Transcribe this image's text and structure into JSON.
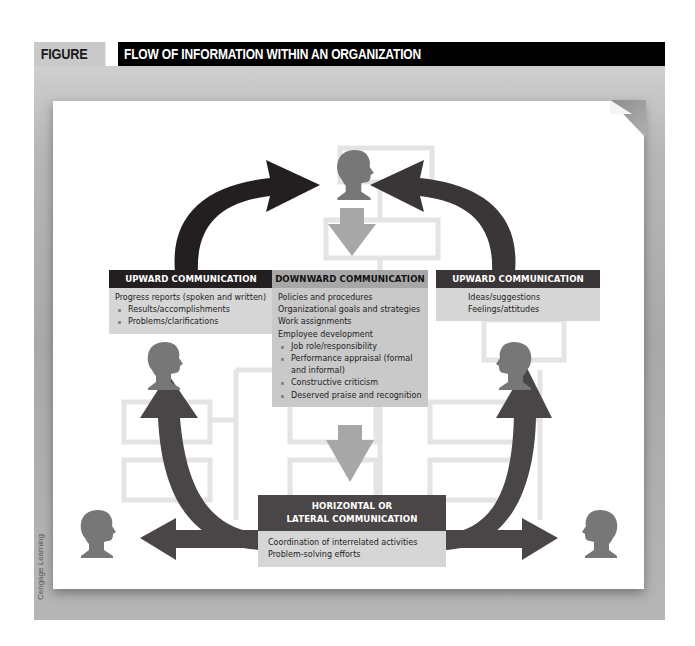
{
  "figure": {
    "number": "FIGURE 1.2",
    "title": "FLOW OF INFORMATION WITHIN AN ORGANIZATION",
    "credit": "Cengage Learning"
  },
  "colors": {
    "header_bg": "#000000",
    "number_bg": "#c9c9c9",
    "upward_left": "#231f20",
    "upward_right": "#3a3536",
    "downward": "#a7a7a7",
    "horizontal": "#4a4546",
    "person": "#777777",
    "org_box": "#e3e3e3",
    "text_panel": "#d6d6d6"
  },
  "boxes": {
    "upward_left": {
      "heading": "UPWARD COMMUNICATION",
      "lines": [
        {
          "text": "Progress reports (spoken and written)",
          "bullet": false
        },
        {
          "text": "Results/accomplishments",
          "bullet": true
        },
        {
          "text": "Problems/clarifications",
          "bullet": true
        }
      ]
    },
    "downward": {
      "heading": "DOWNWARD COMMUNICATION",
      "lines": [
        {
          "text": "Policies and procedures",
          "bullet": false
        },
        {
          "text": "Organizational goals and strategies",
          "bullet": false
        },
        {
          "text": "Work assignments",
          "bullet": false
        },
        {
          "text": "Employee development",
          "bullet": false
        },
        {
          "text": "Job role/responsibility",
          "bullet": true
        },
        {
          "text": "Performance appraisal (formal and informal)",
          "bullet": true
        },
        {
          "text": "Constructive criticism",
          "bullet": true
        },
        {
          "text": "Deserved praise and recognition",
          "bullet": true
        }
      ]
    },
    "upward_right": {
      "heading": "UPWARD COMMUNICATION",
      "lines": [
        {
          "text": "Ideas/suggestions",
          "bullet": false
        },
        {
          "text": "Feelings/attitudes",
          "bullet": false
        }
      ]
    },
    "horizontal": {
      "heading_line1": "HORIZONTAL OR",
      "heading_line2": "LATERAL COMMUNICATION",
      "lines": [
        {
          "text": "Coordination of interrelated activities",
          "bullet": false
        },
        {
          "text": "Problem-solving efforts",
          "bullet": false
        }
      ]
    }
  },
  "people": [
    {
      "id": "top-manager",
      "x": 355,
      "y": 172
    },
    {
      "id": "left-mid-employee",
      "x": 162,
      "y": 366
    },
    {
      "id": "right-mid-employee",
      "x": 512,
      "y": 366
    },
    {
      "id": "left-bottom-employee",
      "x": 97,
      "y": 532
    },
    {
      "id": "right-bottom-employee",
      "x": 598,
      "y": 532
    }
  ]
}
